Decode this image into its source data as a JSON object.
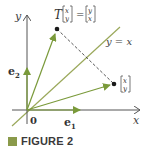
{
  "figure": {
    "caption_label": "FIGURE 2",
    "colors": {
      "vector": "#7a9a3a",
      "line": "#9aa85a",
      "axis": "#555555",
      "point": "#1a1a1a",
      "caption_square": "#8a9a4a"
    }
  },
  "axes": {
    "x_label": "x",
    "y_label": "y",
    "origin_label": "0"
  },
  "vectors": {
    "e1_label": "e",
    "e1_sub": "1",
    "e2_label": "e",
    "e2_sub": "2"
  },
  "line": {
    "label": "y = x"
  },
  "transform": {
    "T": "T",
    "input_top": "x",
    "input_bottom": "y",
    "equals": "=",
    "output_top": "y",
    "output_bottom": "x"
  },
  "point": {
    "top": "x",
    "bottom": "y"
  }
}
